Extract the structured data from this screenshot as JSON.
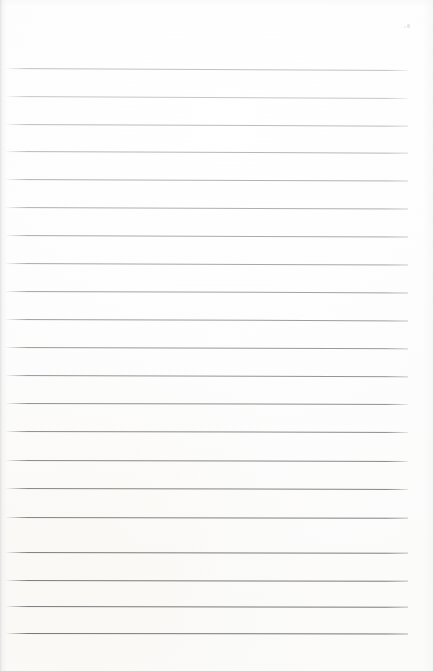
{
  "document": {
    "type": "scanned-lined-paper",
    "title": "Blank lined notepad page",
    "description": "A photographed blank ruled notepad sheet with no written content",
    "written_text": "",
    "page_width": 433,
    "page_height": 671,
    "background_color": "#fdfdfd",
    "paper_color": "#ffffff"
  },
  "ruling": {
    "style": "wide-ruled horizontal lines",
    "line_count": 21,
    "first_line_y": 68,
    "last_line_y": 633,
    "line_spacing": 28.25,
    "line_left_x": 6,
    "line_right_x": 408,
    "line_thickness": 1,
    "top_margin": 68,
    "bottom_margin": 38,
    "left_margin": 6,
    "right_margin": 25,
    "has_vertical_margin_rule": false,
    "tilt_px_over_width": 2,
    "lines": [
      {
        "index": 1,
        "y": 68.0,
        "color": "#c2c2c2",
        "tilt": 2.0
      },
      {
        "index": 2,
        "y": 96.0,
        "color": "#c6c6c6",
        "tilt": 2.0
      },
      {
        "index": 3,
        "y": 123.5,
        "color": "#bdbdbd",
        "tilt": 1.8
      },
      {
        "index": 4,
        "y": 151.0,
        "color": "#b8b8b8",
        "tilt": 1.8
      },
      {
        "index": 5,
        "y": 178.5,
        "color": "#b3b3b3",
        "tilt": 1.6
      },
      {
        "index": 6,
        "y": 206.5,
        "color": "#b0b0b0",
        "tilt": 1.6
      },
      {
        "index": 7,
        "y": 234.5,
        "color": "#ababab",
        "tilt": 1.5
      },
      {
        "index": 8,
        "y": 262.5,
        "color": "#a8a8a8",
        "tilt": 1.5
      },
      {
        "index": 9,
        "y": 290.5,
        "color": "#a3a3a3",
        "tilt": 1.4
      },
      {
        "index": 10,
        "y": 318.5,
        "color": "#9e9e9e",
        "tilt": 1.4
      },
      {
        "index": 11,
        "y": 346.5,
        "color": "#9a9a9a",
        "tilt": 1.2
      },
      {
        "index": 12,
        "y": 375.0,
        "color": "#969696",
        "tilt": 1.2
      },
      {
        "index": 13,
        "y": 403.0,
        "color": "#919191",
        "tilt": 1.0
      },
      {
        "index": 14,
        "y": 431.0,
        "color": "#8d8d8d",
        "tilt": 1.0
      },
      {
        "index": 15,
        "y": 459.5,
        "color": "#898989",
        "tilt": 0.9
      },
      {
        "index": 16,
        "y": 488.0,
        "color": "#868686",
        "tilt": 0.9
      },
      {
        "index": 17,
        "y": 516.5,
        "color": "#828282",
        "tilt": 0.8
      },
      {
        "index": 18,
        "y": 551.5,
        "color": "#7e7e7e",
        "tilt": 0.8
      },
      {
        "index": 19,
        "y": 580.0,
        "color": "#7c7c7c",
        "tilt": 0.7
      },
      {
        "index": 20,
        "y": 606.0,
        "color": "#7a7a7a",
        "tilt": 0.7
      },
      {
        "index": 21,
        "y": 633.0,
        "color": "#787878",
        "tilt": 0.6
      }
    ]
  },
  "artifacts": {
    "specks": [
      {
        "x": 407,
        "y": 24,
        "w": 3,
        "h": 4,
        "color": "#e6e6e6"
      },
      {
        "x": 404,
        "y": 26,
        "w": 2,
        "h": 2,
        "color": "#efefef"
      }
    ],
    "left_edge_shadow": true,
    "scan_banding": true
  }
}
